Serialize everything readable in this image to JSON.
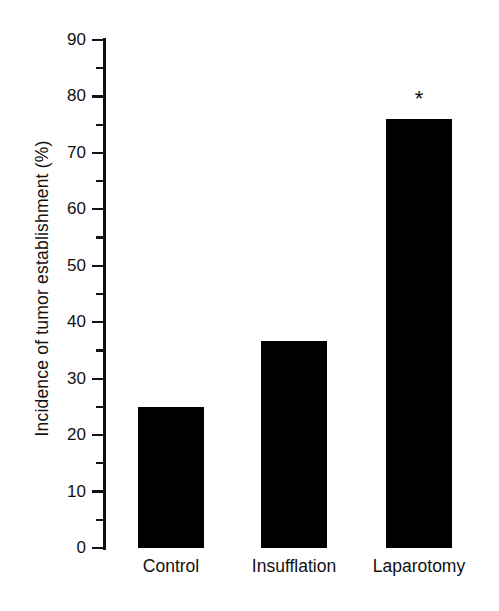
{
  "chart_data": {
    "type": "bar",
    "title": "",
    "subtitle": "",
    "xlabel": "",
    "ylabel": "Incidence of tumor establishment (%)",
    "categories": [
      "Control",
      "Insufflation",
      "Laparotomy"
    ],
    "values": [
      25,
      36.7,
      76
    ],
    "series": [
      {
        "name": "Incidence of tumor establishment",
        "values": [
          25,
          36.7,
          76
        ]
      }
    ],
    "ylim": [
      0,
      90
    ],
    "y_major_ticks": [
      0,
      10,
      20,
      30,
      40,
      50,
      60,
      70,
      80,
      90
    ],
    "y_minor_ticks": [
      5,
      15,
      25,
      35,
      45,
      55,
      65,
      75,
      85
    ],
    "y_tick_labels": [
      "0",
      "10",
      "20",
      "30",
      "40",
      "50",
      "60",
      "70",
      "80",
      "90"
    ],
    "grid": false,
    "legend": false,
    "legend_position": "none",
    "bar_color": "#000000",
    "axis_color": "#111111",
    "background_color": "#ffffff",
    "annotations": [
      {
        "text": "*",
        "category": "Laparotomy",
        "value": 76,
        "meaning": "significance-marker"
      }
    ]
  }
}
